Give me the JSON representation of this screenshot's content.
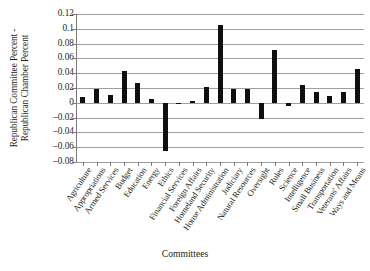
{
  "chart_data": {
    "type": "bar",
    "title": "",
    "xlabel": "Committees",
    "ylabel": "Republican Committee Percent - Republican Chamber Percent",
    "ylabel_lines": [
      "Republican Committee Percent -",
      "Republican Chamber Percent"
    ],
    "ylim": [
      -0.08,
      0.12
    ],
    "ytick_step": 0.02,
    "yticks": [
      0.12,
      0.1,
      0.08,
      0.06,
      0.04,
      0.02,
      0,
      -0.02,
      -0.04,
      -0.06,
      -0.08
    ],
    "ytick_labels": [
      "0.12",
      "0.1",
      "0.08",
      "0.06",
      "0.04",
      "0.02",
      "0",
      "–0.02",
      "–0.04",
      "–0.06",
      "–0.08"
    ],
    "grid": true,
    "grid_axis": "y",
    "legend": "none",
    "bar_color": "#100f0f",
    "categories": [
      "Agriculture",
      "Appropriations",
      "Armed Services",
      "Budget",
      "Education",
      "Energy",
      "Ethics",
      "Financial Services",
      "Foreign Affairs",
      "Homeland Security",
      "House Administration",
      "Judiciary",
      "Natural Resources",
      "Oversight",
      "Rules",
      "Science",
      "Intelligence",
      "Small Business",
      "Transportation",
      "Veterans' Affairs",
      "Ways and Means"
    ],
    "values": [
      0.008,
      0.019,
      0.011,
      0.043,
      0.027,
      0.005,
      -0.065,
      -0.001,
      0.002,
      0.022,
      0.105,
      0.019,
      0.019,
      -0.022,
      0.072,
      -0.004,
      0.024,
      0.014,
      0.009,
      0.015,
      0.046
    ]
  }
}
